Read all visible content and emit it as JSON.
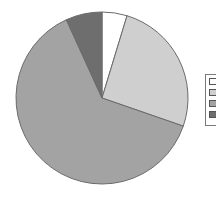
{
  "chart_data": {
    "type": "pie",
    "title": "",
    "start_angle_deg": 0,
    "direction": "clockwise",
    "slices": [
      {
        "label": "",
        "value": 4.7,
        "color": "#ffffff"
      },
      {
        "label": "",
        "value": 25.6,
        "color": "#cfcfcf"
      },
      {
        "label": "",
        "value": 62.9,
        "color": "#a3a3a3"
      },
      {
        "label": "",
        "value": 6.8,
        "color": "#6e6e6e"
      }
    ],
    "legend": {
      "position": "right",
      "entries": [
        "",
        "",
        "",
        ""
      ],
      "note": "legend labels cropped off the right edge of the image"
    }
  },
  "geometry": {
    "cx": 102,
    "cy": 98,
    "r": 86,
    "stroke": "#6b6b6b"
  }
}
